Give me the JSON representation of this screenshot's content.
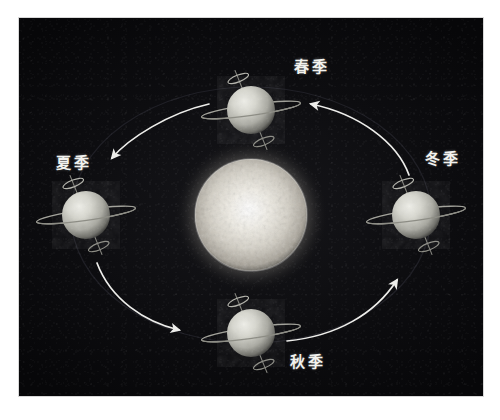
{
  "figure": {
    "kind": "astronomy-diagram",
    "background_color": "#08080a",
    "page_color": "#ffffff",
    "accent_color": "#f2f2ee"
  },
  "sun": {
    "name": "sun",
    "center": {
      "x": 250,
      "y": 215
    },
    "radius": 56,
    "core_color": "#f4f2ec",
    "mid_color": "#cfcbc2",
    "glow_color": "#7e7a70"
  },
  "orbit": {
    "name": "orbit-ellipse",
    "center": {
      "x": 250,
      "y": 215
    },
    "radius_x": 180,
    "radius_y": 128,
    "stroke_color": "#2a2a30"
  },
  "earths": [
    {
      "id": "earth-spring",
      "season_key": "spring",
      "label": "春季",
      "label_romanization": "chunji",
      "label_english": "Spring",
      "center": {
        "x": 250,
        "y": 110
      },
      "radius": 24,
      "axis_tilt_deg": 23,
      "position": "top"
    },
    {
      "id": "earth-summer",
      "season_key": "summer",
      "label": "夏季",
      "label_romanization": "xiaji",
      "label_english": "Summer",
      "center": {
        "x": 85,
        "y": 215
      },
      "radius": 24,
      "axis_tilt_deg": 23,
      "position": "left"
    },
    {
      "id": "earth-autumn",
      "season_key": "autumn",
      "label": "秋季",
      "label_romanization": "qiuji",
      "label_english": "Autumn",
      "center": {
        "x": 250,
        "y": 333
      },
      "radius": 24,
      "axis_tilt_deg": 23,
      "position": "bottom"
    },
    {
      "id": "earth-winter",
      "season_key": "winter",
      "label": "冬季",
      "label_romanization": "dongji",
      "label_english": "Winter",
      "center": {
        "x": 415,
        "y": 215
      },
      "radius": 24,
      "axis_tilt_deg": 23,
      "position": "right"
    }
  ],
  "arrows": [
    {
      "id": "arrow-spring-to-summer",
      "from": "earth-spring",
      "to": "earth-summer",
      "direction": "counterclockwise",
      "color": "#ededea"
    },
    {
      "id": "arrow-summer-to-autumn",
      "from": "earth-summer",
      "to": "earth-autumn",
      "direction": "counterclockwise",
      "color": "#ededea"
    },
    {
      "id": "arrow-autumn-to-winter",
      "from": "earth-autumn",
      "to": "earth-winter",
      "direction": "counterclockwise",
      "color": "#ededea"
    },
    {
      "id": "arrow-winter-to-spring",
      "from": "earth-winter",
      "to": "earth-spring",
      "direction": "counterclockwise",
      "color": "#ededea"
    }
  ]
}
